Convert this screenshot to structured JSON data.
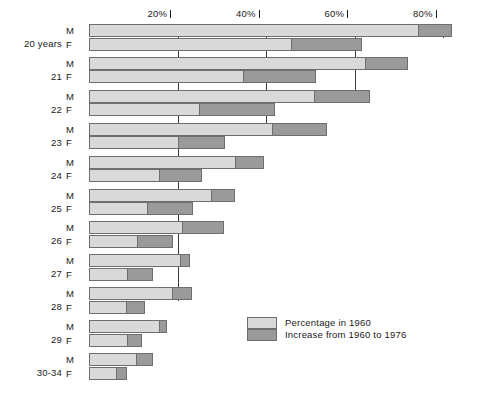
{
  "chart_data": {
    "type": "bar",
    "orientation": "horizontal",
    "stacked": true,
    "title": "",
    "subtitle": "",
    "xlabel": "",
    "ylabel": "",
    "xlim": [
      0,
      88
    ],
    "grid": true,
    "axis_ticks": [
      {
        "value": 20,
        "label": "20%"
      },
      {
        "value": 40,
        "label": "40%"
      },
      {
        "value": 60,
        "label": "60%"
      },
      {
        "value": 80,
        "label": "80%"
      }
    ],
    "legend_position": "inside-bottom-right",
    "legend": [
      {
        "name": "Percentage in 1960",
        "color": "#d9d9d9",
        "key": "light"
      },
      {
        "name": "Increase from 1960 to 1976",
        "color": "#9a9a9a",
        "key": "dark"
      }
    ],
    "series": [
      {
        "name": "Percentage in 1960",
        "color": "#d9d9d9"
      },
      {
        "name": "Increase from 1960 to 1976",
        "color": "#9a9a9a"
      }
    ],
    "categories": [
      "20 years",
      "21",
      "22",
      "23",
      "24",
      "25",
      "26",
      "27",
      "28",
      "29",
      "30-34"
    ],
    "sex_labels": {
      "male": "M",
      "female": "F"
    },
    "groups": [
      {
        "category": "20 years",
        "rows": [
          {
            "sex": "M",
            "base": 74.6,
            "increase": 7.4,
            "total": 82.0
          },
          {
            "sex": "F",
            "base": 45.9,
            "increase": 15.8,
            "total": 61.7
          }
        ]
      },
      {
        "category": "21",
        "rows": [
          {
            "sex": "M",
            "base": 62.6,
            "increase": 9.4,
            "total": 72.0
          },
          {
            "sex": "F",
            "base": 35.0,
            "increase": 16.3,
            "total": 51.3
          }
        ]
      },
      {
        "category": "22",
        "rows": [
          {
            "sex": "M",
            "base": 51.0,
            "increase": 12.5,
            "total": 63.5
          },
          {
            "sex": "F",
            "base": 25.0,
            "increase": 17.0,
            "total": 42.0
          }
        ]
      },
      {
        "category": "23",
        "rows": [
          {
            "sex": "M",
            "base": 41.6,
            "increase": 12.2,
            "total": 53.8
          },
          {
            "sex": "F",
            "base": 20.3,
            "increase": 10.4,
            "total": 30.7
          }
        ]
      },
      {
        "category": "24",
        "rows": [
          {
            "sex": "M",
            "base": 33.2,
            "increase": 6.4,
            "total": 39.6
          },
          {
            "sex": "F",
            "base": 16.0,
            "increase": 9.5,
            "total": 25.5
          }
        ]
      },
      {
        "category": "25",
        "rows": [
          {
            "sex": "M",
            "base": 27.8,
            "increase": 5.2,
            "total": 33.0
          },
          {
            "sex": "F",
            "base": 13.3,
            "increase": 10.2,
            "total": 23.5
          }
        ]
      },
      {
        "category": "26",
        "rows": [
          {
            "sex": "M",
            "base": 21.2,
            "increase": 9.3,
            "total": 30.5
          },
          {
            "sex": "F",
            "base": 11.0,
            "increase": 8.0,
            "total": 19.0
          }
        ]
      },
      {
        "category": "27",
        "rows": [
          {
            "sex": "M",
            "base": 20.8,
            "increase": 2.0,
            "total": 22.8
          },
          {
            "sex": "F",
            "base": 8.8,
            "increase": 5.7,
            "total": 14.5
          }
        ]
      },
      {
        "category": "28",
        "rows": [
          {
            "sex": "M",
            "base": 19.0,
            "increase": 4.3,
            "total": 23.3
          },
          {
            "sex": "F",
            "base": 8.6,
            "increase": 4.1,
            "total": 12.7
          }
        ]
      },
      {
        "category": "29",
        "rows": [
          {
            "sex": "M",
            "base": 16.0,
            "increase": 1.6,
            "total": 17.6
          },
          {
            "sex": "F",
            "base": 8.8,
            "increase": 3.1,
            "total": 11.9
          }
        ]
      },
      {
        "category": "30-34",
        "rows": [
          {
            "sex": "M",
            "base": 10.8,
            "increase": 3.7,
            "total": 14.5
          },
          {
            "sex": "F",
            "base": 6.3,
            "increase": 2.3,
            "total": 8.6
          }
        ]
      }
    ]
  },
  "layout": {
    "plot_left_px": 89,
    "px_per_percent": 4.425,
    "axis_top_px": 24,
    "plot_bottom_px": 386,
    "group_start_px": 24,
    "group_pitch_px": 32.9,
    "row_height_px": 13
  }
}
